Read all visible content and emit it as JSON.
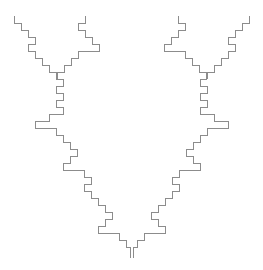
{
  "canvas": {
    "width": 263,
    "height": 270,
    "background_color": "#ffffff",
    "description": "Two mirror-symmetric orthogonal staircase fractal curves forming an antler/V shape"
  },
  "style": {
    "stroke_color": "#8c8c8c",
    "stroke_width": 1,
    "fill": "none"
  },
  "chart_data": {
    "type": "line",
    "title": "",
    "xlabel": "",
    "ylabel": "",
    "grid": false,
    "legend": null,
    "xlim": [
      0,
      263
    ],
    "ylim": [
      0,
      270
    ],
    "mirror_axis_x": 131.5,
    "series": [
      {
        "name": "left-branch-short-tine",
        "points": [
          [
            14,
            16
          ],
          [
            14,
            23
          ],
          [
            21,
            23
          ],
          [
            21,
            30
          ],
          [
            28,
            30
          ],
          [
            28,
            37
          ],
          [
            35,
            37
          ],
          [
            35,
            44
          ],
          [
            28,
            44
          ],
          [
            28,
            51
          ],
          [
            35,
            51
          ],
          [
            35,
            58
          ],
          [
            42,
            58
          ],
          [
            42,
            65
          ],
          [
            49,
            65
          ],
          [
            49,
            72
          ],
          [
            56,
            72
          ],
          [
            56,
            79
          ]
        ]
      },
      {
        "name": "left-branch-tall-tine",
        "points": [
          [
            85,
            16
          ],
          [
            85,
            23
          ],
          [
            78,
            23
          ],
          [
            78,
            30
          ],
          [
            85,
            30
          ],
          [
            85,
            37
          ],
          [
            92,
            37
          ],
          [
            92,
            44
          ],
          [
            99,
            44
          ],
          [
            99,
            51
          ],
          [
            78,
            51
          ],
          [
            78,
            58
          ],
          [
            71,
            58
          ],
          [
            71,
            65
          ],
          [
            64,
            65
          ],
          [
            64,
            72
          ],
          [
            57,
            72
          ],
          [
            57,
            79
          ]
        ]
      },
      {
        "name": "left-trunk",
        "points": [
          [
            56,
            79
          ],
          [
            63,
            79
          ],
          [
            63,
            86
          ],
          [
            56,
            86
          ],
          [
            56,
            93
          ],
          [
            63,
            93
          ],
          [
            63,
            100
          ],
          [
            56,
            100
          ],
          [
            56,
            107
          ],
          [
            63,
            107
          ],
          [
            63,
            114
          ],
          [
            49,
            114
          ],
          [
            49,
            121
          ],
          [
            35,
            121
          ],
          [
            35,
            128
          ],
          [
            56,
            128
          ],
          [
            56,
            135
          ],
          [
            63,
            135
          ],
          [
            63,
            142
          ],
          [
            70,
            142
          ],
          [
            70,
            149
          ],
          [
            77,
            149
          ],
          [
            77,
            156
          ],
          [
            70,
            156
          ],
          [
            70,
            163
          ],
          [
            63,
            163
          ],
          [
            63,
            170
          ],
          [
            84,
            170
          ],
          [
            84,
            177
          ],
          [
            91,
            177
          ],
          [
            91,
            184
          ],
          [
            84,
            184
          ],
          [
            84,
            191
          ],
          [
            91,
            191
          ],
          [
            91,
            198
          ],
          [
            98,
            198
          ],
          [
            98,
            205
          ],
          [
            105,
            205
          ],
          [
            105,
            212
          ],
          [
            112,
            212
          ],
          [
            112,
            219
          ],
          [
            105,
            219
          ],
          [
            105,
            226
          ],
          [
            98,
            226
          ],
          [
            98,
            233
          ],
          [
            119,
            233
          ],
          [
            119,
            240
          ],
          [
            126,
            240
          ],
          [
            126,
            247
          ],
          [
            130,
            247
          ],
          [
            130,
            258
          ]
        ]
      },
      {
        "name": "right-branch-short-tine-mirrored",
        "points": [
          [
            249,
            16
          ],
          [
            249,
            23
          ],
          [
            242,
            23
          ],
          [
            242,
            30
          ],
          [
            235,
            30
          ],
          [
            235,
            37
          ],
          [
            228,
            37
          ],
          [
            228,
            44
          ],
          [
            235,
            44
          ],
          [
            235,
            51
          ],
          [
            228,
            51
          ],
          [
            228,
            58
          ],
          [
            221,
            58
          ],
          [
            221,
            65
          ],
          [
            214,
            65
          ],
          [
            214,
            72
          ],
          [
            207,
            72
          ],
          [
            207,
            79
          ]
        ]
      },
      {
        "name": "right-branch-tall-tine-mirrored",
        "points": [
          [
            178,
            16
          ],
          [
            178,
            23
          ],
          [
            185,
            23
          ],
          [
            185,
            30
          ],
          [
            178,
            30
          ],
          [
            178,
            37
          ],
          [
            171,
            37
          ],
          [
            171,
            44
          ],
          [
            164,
            44
          ],
          [
            164,
            51
          ],
          [
            185,
            51
          ],
          [
            185,
            58
          ],
          [
            192,
            58
          ],
          [
            192,
            65
          ],
          [
            199,
            65
          ],
          [
            199,
            72
          ],
          [
            206,
            72
          ],
          [
            206,
            79
          ]
        ]
      },
      {
        "name": "right-trunk-mirrored",
        "points": [
          [
            207,
            79
          ],
          [
            200,
            79
          ],
          [
            200,
            86
          ],
          [
            207,
            86
          ],
          [
            207,
            93
          ],
          [
            200,
            93
          ],
          [
            200,
            100
          ],
          [
            207,
            100
          ],
          [
            207,
            107
          ],
          [
            200,
            107
          ],
          [
            200,
            114
          ],
          [
            214,
            114
          ],
          [
            214,
            121
          ],
          [
            228,
            121
          ],
          [
            228,
            128
          ],
          [
            207,
            128
          ],
          [
            207,
            135
          ],
          [
            200,
            135
          ],
          [
            200,
            142
          ],
          [
            193,
            142
          ],
          [
            193,
            149
          ],
          [
            186,
            149
          ],
          [
            186,
            156
          ],
          [
            193,
            156
          ],
          [
            193,
            163
          ],
          [
            200,
            163
          ],
          [
            200,
            170
          ],
          [
            179,
            170
          ],
          [
            179,
            177
          ],
          [
            172,
            177
          ],
          [
            172,
            184
          ],
          [
            179,
            184
          ],
          [
            179,
            191
          ],
          [
            172,
            191
          ],
          [
            172,
            198
          ],
          [
            165,
            198
          ],
          [
            165,
            205
          ],
          [
            158,
            205
          ],
          [
            158,
            212
          ],
          [
            151,
            212
          ],
          [
            151,
            219
          ],
          [
            158,
            219
          ],
          [
            158,
            226
          ],
          [
            165,
            226
          ],
          [
            165,
            233
          ],
          [
            144,
            233
          ],
          [
            144,
            240
          ],
          [
            137,
            240
          ],
          [
            137,
            247
          ],
          [
            133,
            247
          ],
          [
            133,
            258
          ]
        ]
      }
    ]
  }
}
